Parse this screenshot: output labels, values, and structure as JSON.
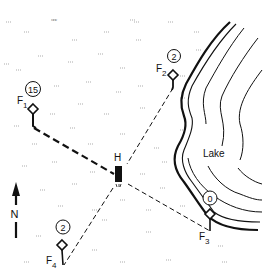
{
  "map": {
    "lake_label": "Lake",
    "north_label": "N",
    "house_label": "H",
    "colors": {
      "ink": "#111111",
      "background": "#ffffff",
      "grass": "#777777"
    },
    "fields": [
      {
        "id": "F1",
        "label_main": "F",
        "label_sub": "1",
        "count": "15"
      },
      {
        "id": "F2",
        "label_main": "F",
        "label_sub": "2",
        "count": "2"
      },
      {
        "id": "F3",
        "label_main": "F",
        "label_sub": "3",
        "count": "0"
      },
      {
        "id": "F4",
        "label_main": "F",
        "label_sub": "4",
        "count": "2"
      }
    ]
  }
}
